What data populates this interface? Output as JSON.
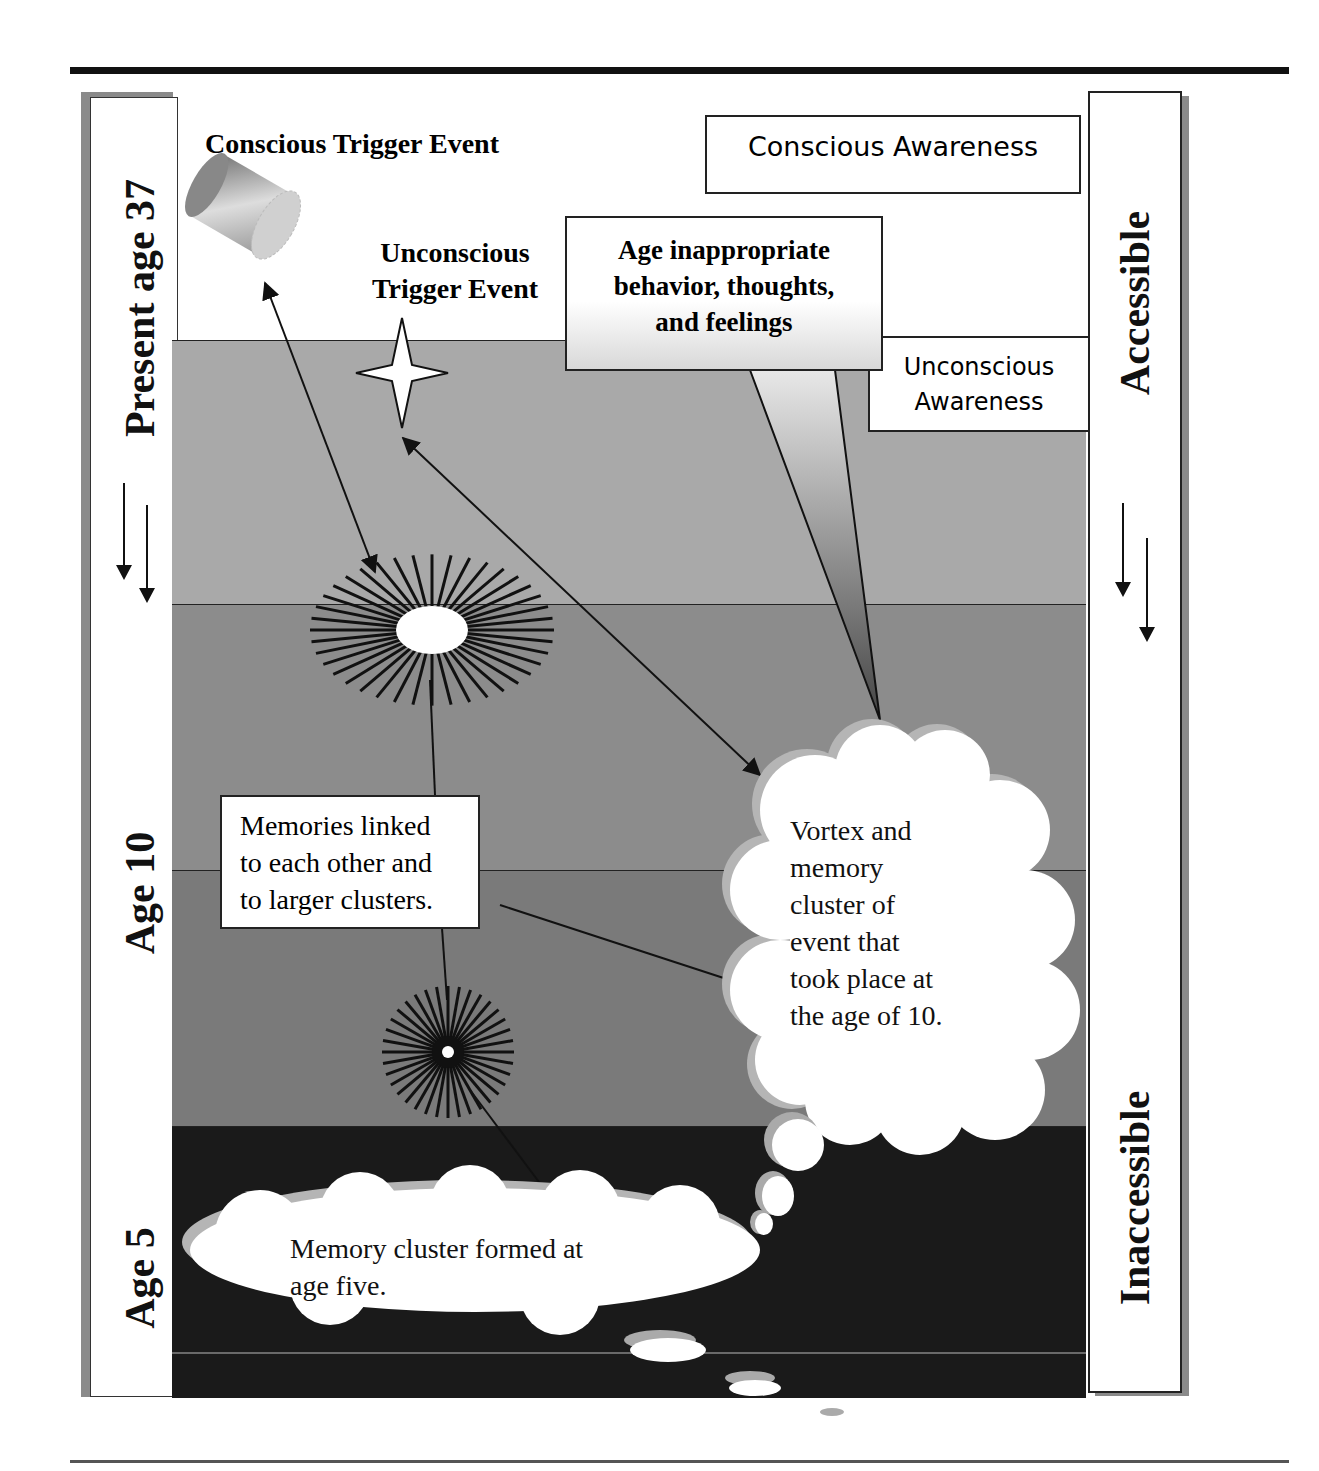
{
  "diagram": {
    "left_axis": {
      "labels": [
        "Present age 37",
        "Age 10",
        "Age 5"
      ],
      "arrow_icon": "double-down-arrow"
    },
    "right_axis": {
      "labels": [
        "Accessible",
        "Inaccessible"
      ],
      "arrow_icon": "double-down-arrow"
    },
    "awareness_boxes": {
      "conscious": "Conscious Awareness",
      "unconscious_line1": "Unconscious",
      "unconscious_line2": "Awareness"
    },
    "triggers": {
      "conscious": "Conscious Trigger Event",
      "unconscious_line1": "Unconscious",
      "unconscious_line2": "Trigger Event"
    },
    "callout": {
      "line1": "Age inappropriate",
      "line2": "behavior, thoughts,",
      "line3": "and feelings"
    },
    "memories_box": {
      "line1": "Memories linked",
      "line2": "to each other and",
      "line3": "to larger clusters."
    },
    "vortex_cloud": {
      "lines": [
        "Vortex and",
        "memory",
        "cluster of",
        "event that",
        "took place at",
        "the age of 10."
      ]
    },
    "age5_cloud": {
      "line1": "Memory cluster formed at",
      "line2": "age five."
    },
    "bands": [
      {
        "name": "present",
        "color": "#a9a9a9"
      },
      {
        "name": "upper-middle",
        "color": "#8c8c8c"
      },
      {
        "name": "lower-middle",
        "color": "#7a7a7a"
      },
      {
        "name": "deep",
        "color": "#1a1a1a"
      }
    ]
  }
}
